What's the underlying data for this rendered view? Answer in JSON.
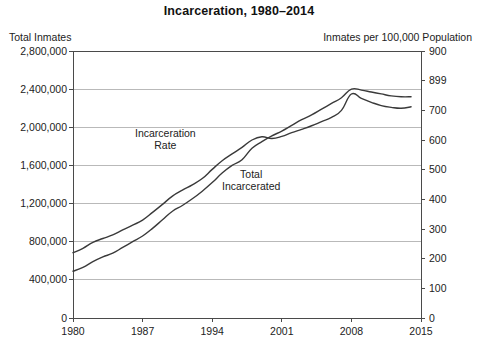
{
  "chart_data": {
    "type": "line",
    "title": "Incarceration, 1980–2014",
    "xlabel": "",
    "ylabel": "Total Inmates",
    "y2label": "Inmates per 100,000 Population",
    "grid": true,
    "legend_position": "inline-annotations",
    "xlim": [
      1980,
      2015
    ],
    "xticks": [
      "1980",
      "1987",
      "1994",
      "2001",
      "2008",
      "2015"
    ],
    "ylim": [
      0,
      2800000
    ],
    "yticks": [
      "0",
      "400,000",
      "800,000",
      "1,200,000",
      "1,600,000",
      "2,000,000",
      "2,400,000",
      "2,800,000"
    ],
    "y2lim": [
      0,
      900
    ],
    "y2ticks": [
      "0",
      "100",
      "200",
      "300",
      "400",
      "500",
      "600",
      "700",
      "899",
      "900"
    ],
    "series": [
      {
        "name": "Incarceration Rate",
        "axis": "right",
        "color": "#3a3a3a",
        "x": [
          1980,
          1981,
          1982,
          1983,
          1984,
          1985,
          1986,
          1987,
          1988,
          1989,
          1990,
          1991,
          1992,
          1993,
          1994,
          1995,
          1996,
          1997,
          1998,
          1999,
          2000,
          2001,
          2002,
          2003,
          2004,
          2005,
          2006,
          2007,
          2008,
          2009,
          2010,
          2011,
          2012,
          2013,
          2014
        ],
        "values": [
          220,
          235,
          255,
          268,
          280,
          297,
          313,
          330,
          356,
          383,
          411,
          431,
          449,
          470,
          501,
          530,
          553,
          575,
          600,
          611,
          605,
          612,
          625,
          636,
          648,
          662,
          676,
          700,
          755,
          740,
          727,
          716,
          710,
          707,
          712
        ]
      },
      {
        "name": "Total Incarcerated",
        "axis": "left",
        "color": "#3a3a3a",
        "x": [
          1980,
          1981,
          1982,
          1983,
          1984,
          1985,
          1986,
          1987,
          1988,
          1989,
          1990,
          1991,
          1992,
          1993,
          1994,
          1995,
          1996,
          1997,
          1998,
          1999,
          2000,
          2001,
          2002,
          2003,
          2004,
          2005,
          2006,
          2007,
          2008,
          2009,
          2010,
          2011,
          2012,
          2013,
          2014
        ],
        "values": [
          490000,
          530000,
          590000,
          640000,
          680000,
          740000,
          800000,
          860000,
          940000,
          1030000,
          1120000,
          1180000,
          1250000,
          1330000,
          1420000,
          1520000,
          1600000,
          1660000,
          1780000,
          1850000,
          1910000,
          1960000,
          2020000,
          2080000,
          2130000,
          2190000,
          2250000,
          2310000,
          2400000,
          2390000,
          2370000,
          2350000,
          2330000,
          2320000,
          2320000
        ]
      }
    ],
    "annotations": [
      {
        "text_line1": "Incarceration",
        "text_line2": "Rate"
      },
      {
        "text_line1": "Total",
        "text_line2": "Incarcerated"
      }
    ]
  }
}
